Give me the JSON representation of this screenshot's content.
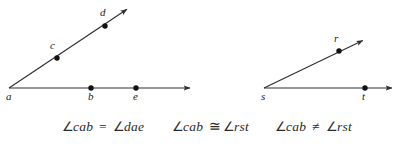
{
  "figure": {
    "background_color": "#ffffff",
    "stroke_color": "#2e2e2e",
    "dot_color": "#111111",
    "text_color": "#2b2b2b",
    "left_diagram": {
      "name": "angle-cab-dae",
      "vertex": {
        "label": "a",
        "x": 9,
        "y": 88,
        "label_x": 6,
        "label_y": 100
      },
      "rays": [
        {
          "name": "ray-ab",
          "from_x": 9,
          "from_y": 88,
          "to_x": 196,
          "to_y": 88
        },
        {
          "name": "ray-ac",
          "from_x": 9,
          "from_y": 88,
          "to_x": 131,
          "to_y": 6
        }
      ],
      "points": [
        {
          "label": "b",
          "x": 91,
          "y": 88,
          "label_x": 88,
          "label_y": 100
        },
        {
          "label": "e",
          "x": 136,
          "y": 88,
          "label_x": 133,
          "label_y": 100
        },
        {
          "label": "c",
          "x": 57,
          "y": 58,
          "label_x": 50,
          "label_y": 49
        },
        {
          "label": "d",
          "x": 105,
          "y": 26,
          "label_x": 100,
          "label_y": 16
        }
      ]
    },
    "right_diagram": {
      "name": "angle-rst",
      "vertex": {
        "label": "s",
        "x": 264,
        "y": 88,
        "label_x": 261,
        "label_y": 100
      },
      "rays": [
        {
          "name": "ray-st",
          "from_x": 264,
          "from_y": 88,
          "to_x": 398,
          "to_y": 88
        },
        {
          "name": "ray-sr",
          "from_x": 264,
          "from_y": 88,
          "to_x": 368,
          "to_y": 38
        }
      ],
      "points": [
        {
          "label": "t",
          "x": 365,
          "y": 88,
          "label_x": 362,
          "label_y": 100
        },
        {
          "label": "r",
          "x": 339,
          "y": 51,
          "label_x": 334,
          "label_y": 42
        }
      ]
    }
  },
  "captions": {
    "baseline_y": 131,
    "items": [
      {
        "name": "caption-equal",
        "x": 62,
        "angle_symbol": "∠",
        "left_term": "cab",
        "operator": "=",
        "right_term": "dae",
        "full_text": "∠cab = ∠dae"
      },
      {
        "name": "caption-congruent",
        "x": 172,
        "angle_symbol": "∠",
        "left_term": "cab",
        "operator": "≅",
        "right_term": "rst",
        "full_text": "∠cab ≅ ∠rst"
      },
      {
        "name": "caption-not-equal",
        "x": 275,
        "angle_symbol": "∠",
        "left_term": "cab",
        "operator": "≠",
        "right_term": "rst",
        "full_text": "∠cab ≠ ∠rst"
      }
    ]
  }
}
